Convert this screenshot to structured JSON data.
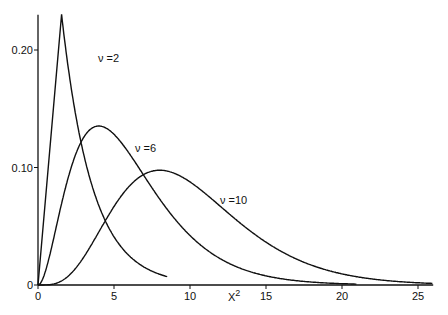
{
  "chart_data": {
    "type": "line",
    "title": "",
    "xlabel": "χ²",
    "ylabel": "",
    "xlim": [
      0,
      26
    ],
    "ylim": [
      0,
      0.23
    ],
    "x_ticks": [
      "0",
      "5",
      "10",
      "15",
      "20",
      "25"
    ],
    "y_ticks": [
      "0",
      "0.10",
      "0.20"
    ],
    "grid": false,
    "legend": "inline labels",
    "series": [
      {
        "name": "ν = 2",
        "df": 2,
        "label": "ν =2"
      },
      {
        "name": "ν = 6",
        "df": 6,
        "label": "ν =6"
      },
      {
        "name": "ν = 10",
        "df": 10,
        "label": "ν =10"
      }
    ]
  }
}
